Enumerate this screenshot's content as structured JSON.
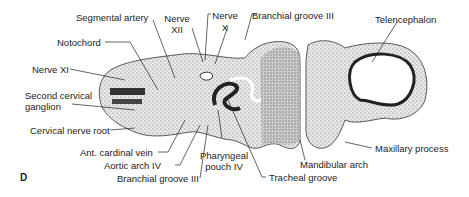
{
  "figure": {
    "panel_letter": "D",
    "labels": {
      "segmental_artery": "Segmental artery",
      "nerve_xii_1": "Nerve",
      "nerve_xii_2": "XII",
      "nerve_x_1": "Nerve",
      "nerve_x_2": "X",
      "branchial_groove_top": "Branchial groove III",
      "telencephalon": "Telencephalon",
      "notochord": "Notochord",
      "nerve_xi": "Nerve XI",
      "second_cervical_1": "Second cervical",
      "second_cervical_2": "ganglion",
      "cervical_nerve_root": "Cervical nerve root",
      "ant_cardinal_vein": "Ant. cardinal vein",
      "aortic_arch_iv": "Aortic arch IV",
      "branchial_groove_bottom": "Branchial groove III",
      "pharyngeal_pouch_1": "Pharyngeal",
      "pharyngeal_pouch_2": "pouch IV",
      "tracheal_groove": "Tracheal groove",
      "mandibular_arch": "Mandibular arch",
      "maxillary_process": "Maxillary process"
    }
  }
}
